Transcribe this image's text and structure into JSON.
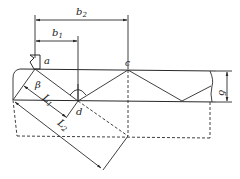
{
  "diagram": {
    "title": "",
    "colors": {
      "line": "#2a2a2a",
      "background": "#ffffff"
    },
    "labels": {
      "b1": "b",
      "b1_sub": "1",
      "b2": "b",
      "b2_sub": "2",
      "a": "a",
      "c": "c",
      "d": "d",
      "beta": "β",
      "L1": "L",
      "L1_sub": "1",
      "L2": "L",
      "L2_sub": "2",
      "delta": "δ"
    },
    "elements": [
      "probe-symbol",
      "plate-top-surface",
      "plate-bottom-surface",
      "beam-zigzag-path",
      "dimension-b1",
      "dimension-b2",
      "dimension-thickness-delta",
      "dimension-L1",
      "dimension-L2",
      "dashed-reflection-outline",
      "angle-beta-arc"
    ]
  }
}
